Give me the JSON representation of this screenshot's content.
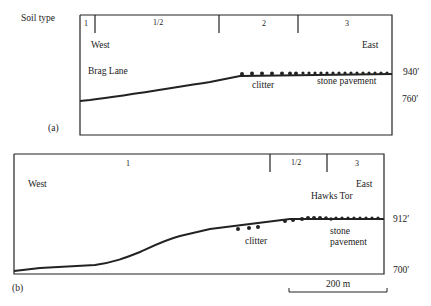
{
  "soil_type_label": "Soil type",
  "profile_a": {
    "label": "(a)",
    "soil_zones": [
      "1",
      "1/2",
      "2",
      "3"
    ],
    "west": "West",
    "east": "East",
    "place": "Brag Lane",
    "clitter": "clitter",
    "pavement": "stone pavement",
    "elev_top": "940′",
    "elev_bottom": "760′"
  },
  "profile_b": {
    "label": "(b)",
    "soil_zones": [
      "1",
      "1/2",
      "3"
    ],
    "west": "West",
    "east": "East",
    "place": "Hawks Tor",
    "clitter": "clitter",
    "pavement_line1": "stone",
    "pavement_line2": "pavement",
    "elev_top": "912′",
    "elev_bottom": "700′"
  },
  "scale_bar": "200 m"
}
